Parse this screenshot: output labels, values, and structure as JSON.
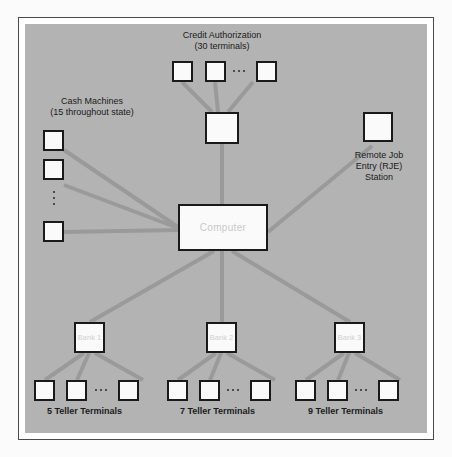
{
  "figure": {
    "panel_color": "#b3b3b3",
    "node_fill": "#fafafa",
    "node_border": "#1a1a1a",
    "link_color": "#9a9a9a",
    "node_label_color": "#cfcfcf",
    "text_color": "#1b1b1b"
  },
  "center": {
    "computer_label": "Computer"
  },
  "credit": {
    "label": "Credit Authorization\n(30 terminals)",
    "title": "Credit Authorization",
    "count_text": "(30 terminals)",
    "terminal_count": 3,
    "ellipsis": "..."
  },
  "cash": {
    "label": "Cash Machines\n(15 throughout state)",
    "title": "Cash Machines",
    "count_text": "(15 throughout state)",
    "terminal_count": 3,
    "ellipsis": "..."
  },
  "rje": {
    "label": "Remote Job\nEntry (RJE)\nStation"
  },
  "banks": [
    {
      "name": "Bank",
      "number": "1",
      "label": "Bank\n1",
      "tellers_label": "5 Teller Terminals",
      "teller_count": 3
    },
    {
      "name": "Bank",
      "number": "2",
      "label": "Bank\n2",
      "tellers_label": "7 Teller Terminals",
      "teller_count": 3
    },
    {
      "name": "Bank",
      "number": "3",
      "label": "Bank\n3",
      "tellers_label": "9 Teller Terminals",
      "teller_count": 3
    }
  ]
}
